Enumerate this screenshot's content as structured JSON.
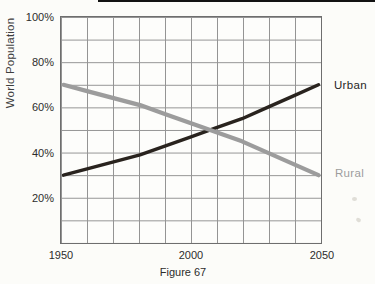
{
  "chart_data": {
    "type": "line",
    "title": "",
    "caption": "Figure 67",
    "ylabel": "World Population",
    "xlabel": "",
    "x": [
      1950,
      1960,
      1970,
      1980,
      1990,
      2000,
      2010,
      2020,
      2030,
      2040,
      2050
    ],
    "series": [
      {
        "name": "Urban",
        "color": "#29231e",
        "stroke_width": 3.4,
        "values": [
          30,
          33,
          36,
          39,
          43,
          47,
          51,
          55,
          60,
          65,
          70
        ]
      },
      {
        "name": "Rural",
        "color": "#9c9c9c",
        "stroke_width": 4.2,
        "values": [
          70,
          67,
          64,
          61,
          57,
          53,
          49,
          45,
          40,
          35,
          30
        ]
      }
    ],
    "xlim": [
      1950,
      2050
    ],
    "ylim": [
      0,
      100
    ],
    "x_ticks": [
      1950,
      2000,
      2050
    ],
    "x_tick_labels": [
      "1950",
      "2000",
      "2050"
    ],
    "y_ticks": [
      100,
      80,
      60,
      40,
      20
    ],
    "y_tick_labels": [
      "100%",
      "80%",
      "60%",
      "40%",
      "20%"
    ],
    "grid": {
      "on": true,
      "x_step_years": 10,
      "y_step_percent": 10,
      "color": "#949494"
    },
    "legend": {
      "position": "inline-right",
      "entries": [
        "Urban",
        "Rural"
      ]
    },
    "crossing_point": {
      "year": 2007,
      "percent": 50
    }
  }
}
